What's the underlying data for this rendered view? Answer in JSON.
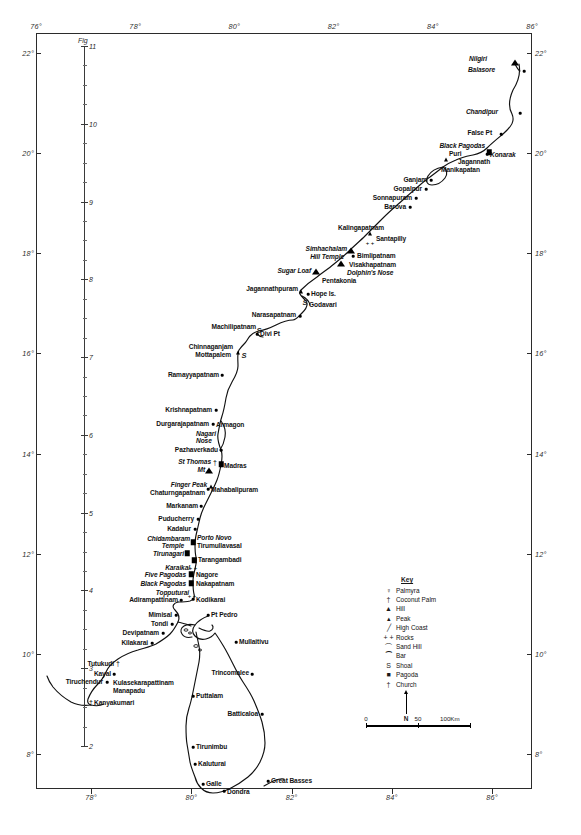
{
  "figure": {
    "caption_label": "Fig",
    "inner_scale_top_number": "11",
    "inner_scale_numbers": [
      "11",
      "10",
      "9",
      "8",
      "7",
      "6",
      "5",
      "4",
      "3",
      "2"
    ]
  },
  "axes": {
    "longitude_unit": "°",
    "top_ticks": [
      "76°",
      "78°",
      "80°",
      "82°",
      "84°",
      "86°"
    ],
    "bottom_ticks": [
      "78°",
      "80°",
      "82°",
      "84°",
      "86°"
    ],
    "left_ticks": [
      "22°",
      "20°",
      "18°",
      "16°",
      "14°",
      "12°",
      "10°",
      "8°"
    ],
    "right_ticks": [
      "22°",
      "20°",
      "18°",
      "16°",
      "14°",
      "12°",
      "10°",
      "8°"
    ]
  },
  "key": {
    "title": "Key",
    "items": [
      {
        "icon": "palmyra-icon",
        "glyph": "♀",
        "label": "Palmyra"
      },
      {
        "icon": "coconut-palm-icon",
        "glyph": "†",
        "label": "Coconut Palm"
      },
      {
        "icon": "hill-icon",
        "glyph": "▲",
        "label": "Hill"
      },
      {
        "icon": "peak-icon",
        "glyph": "▴",
        "label": "Peak"
      },
      {
        "icon": "high-coast-icon",
        "glyph": "╱",
        "label": "High Coast"
      },
      {
        "icon": "rocks-icon",
        "glyph": "+ +",
        "label": "Rocks"
      },
      {
        "icon": "sand-hill-icon",
        "glyph": "⌒",
        "label": "Sand Hill"
      },
      {
        "icon": "bar-icon",
        "glyph": "⁀",
        "label": "Bar"
      },
      {
        "icon": "shoal-icon",
        "glyph": "S",
        "label": "Shoal"
      },
      {
        "icon": "pagoda-icon",
        "glyph": "■",
        "label": "Pagoda"
      },
      {
        "icon": "church-icon",
        "glyph": "†",
        "label": "Church"
      }
    ]
  },
  "north_arrow": {
    "label": "N"
  },
  "scale_bar": {
    "start": "0",
    "middle": "50",
    "end": "100Km"
  },
  "places": [
    {
      "name": "Nilgiri",
      "x": 487,
      "y": 59,
      "align": "r",
      "italic": true,
      "symbol": "hill",
      "sx": 515,
      "sy": 63
    },
    {
      "name": "Balasore",
      "x": 495,
      "y": 70,
      "align": "r",
      "italic": true,
      "symbol": "dot",
      "sx": 524,
      "sy": 71
    },
    {
      "name": "Chandipur",
      "x": 498,
      "y": 112,
      "align": "r",
      "italic": true,
      "symbol": "dot",
      "sx": 520,
      "sy": 113
    },
    {
      "name": "False Pt",
      "x": 492,
      "y": 133,
      "align": "r",
      "italic": false,
      "symbol": "dot",
      "sx": 501,
      "sy": 134
    },
    {
      "name": "Black Pagodas",
      "x": 485,
      "y": 146,
      "align": "r",
      "italic": true,
      "symbol": "pagoda",
      "sx": 489,
      "sy": 152
    },
    {
      "name": "Konarak",
      "x": 490,
      "y": 155,
      "align": "l",
      "italic": true,
      "symbol": "dot",
      "sx": 487,
      "sy": 154
    },
    {
      "name": "Puri",
      "x": 449,
      "y": 154,
      "align": "l",
      "italic": false,
      "symbol": "peak",
      "sx": 446,
      "sy": 160
    },
    {
      "name": "Jagannath",
      "x": 458,
      "y": 162,
      "align": "l",
      "italic": false,
      "symbol": "none",
      "sx": 0,
      "sy": 0
    },
    {
      "name": "Manikapatan",
      "x": 441,
      "y": 170,
      "align": "l",
      "italic": false,
      "symbol": "none",
      "sx": 0,
      "sy": 0
    },
    {
      "name": "Ganjam",
      "x": 427,
      "y": 180,
      "align": "r",
      "italic": false,
      "symbol": "dot",
      "sx": 431,
      "sy": 180
    },
    {
      "name": "Gopalpur",
      "x": 422,
      "y": 189,
      "align": "r",
      "italic": false,
      "symbol": "dot",
      "sx": 426,
      "sy": 189
    },
    {
      "name": "Sonnapuram",
      "x": 412,
      "y": 198,
      "align": "r",
      "italic": false,
      "symbol": "dot",
      "sx": 416,
      "sy": 198
    },
    {
      "name": "Barova",
      "x": 406,
      "y": 207,
      "align": "r",
      "italic": false,
      "symbol": "dot",
      "sx": 410,
      "sy": 207
    },
    {
      "name": "Kalingapatnam",
      "x": 384,
      "y": 228,
      "align": "r",
      "italic": false,
      "symbol": "peak",
      "sx": 370,
      "sy": 234
    },
    {
      "name": "Santapilly",
      "x": 376,
      "y": 239,
      "align": "l",
      "italic": false,
      "symbol": "rocks",
      "sx": 370,
      "sy": 243
    },
    {
      "name": "Simhachalam",
      "x": 347,
      "y": 249,
      "align": "r",
      "italic": true,
      "symbol": "hill",
      "sx": 351,
      "sy": 251
    },
    {
      "name": "Hill Temple",
      "x": 344,
      "y": 257,
      "align": "r",
      "italic": true,
      "symbol": "none",
      "sx": 0,
      "sy": 0
    },
    {
      "name": "Bimlipatnam",
      "x": 357,
      "y": 256,
      "align": "l",
      "italic": false,
      "symbol": "dot",
      "sx": 353,
      "sy": 256
    },
    {
      "name": "Visakhapatnam",
      "x": 349,
      "y": 265,
      "align": "l",
      "italic": false,
      "symbol": "hill",
      "sx": 341,
      "sy": 264
    },
    {
      "name": "Dolphin's Nose",
      "x": 347,
      "y": 273,
      "align": "l",
      "italic": true,
      "symbol": "none",
      "sx": 0,
      "sy": 0
    },
    {
      "name": "Sugar Loaf",
      "x": 311,
      "y": 271,
      "align": "r",
      "italic": true,
      "symbol": "hill",
      "sx": 316,
      "sy": 272
    },
    {
      "name": "Pentakonia",
      "x": 322,
      "y": 281,
      "align": "l",
      "italic": false,
      "symbol": "none",
      "sx": 0,
      "sy": 0
    },
    {
      "name": "Jagannathpuram",
      "x": 298,
      "y": 289,
      "align": "r",
      "italic": false,
      "symbol": "peak",
      "sx": 301,
      "sy": 292
    },
    {
      "name": "Hope Is.",
      "x": 311,
      "y": 294,
      "align": "l",
      "italic": false,
      "symbol": "dot",
      "sx": 308,
      "sy": 294
    },
    {
      "name": "Godavari",
      "x": 309,
      "y": 305,
      "align": "l",
      "italic": false,
      "symbol": "shoal",
      "sx": 305,
      "sy": 302
    },
    {
      "name": "Narasapatnam",
      "x": 296,
      "y": 315,
      "align": "r",
      "italic": false,
      "symbol": "dot",
      "sx": 300,
      "sy": 316
    },
    {
      "name": "Machilipatnam",
      "x": 256,
      "y": 327,
      "align": "r",
      "italic": false,
      "symbol": "shoal",
      "sx": 259,
      "sy": 330
    },
    {
      "name": "Divi Pt",
      "x": 260,
      "y": 334,
      "align": "l",
      "italic": false,
      "symbol": "dot",
      "sx": 257,
      "sy": 334
    },
    {
      "name": "Chinnaganjam",
      "x": 233,
      "y": 347,
      "align": "r",
      "italic": false,
      "symbol": "peak",
      "sx": 238,
      "sy": 353
    },
    {
      "name": "Mottapalem",
      "x": 231,
      "y": 355,
      "align": "r",
      "italic": false,
      "symbol": "shoal",
      "sx": 244,
      "sy": 355
    },
    {
      "name": "Ramayyapatnam",
      "x": 219,
      "y": 375,
      "align": "r",
      "italic": false,
      "symbol": "dot",
      "sx": 222,
      "sy": 375
    },
    {
      "name": "Krishnapatnam",
      "x": 212,
      "y": 410,
      "align": "r",
      "italic": false,
      "symbol": "dot",
      "sx": 216,
      "sy": 410
    },
    {
      "name": "Durgarajapatnam",
      "x": 209,
      "y": 424,
      "align": "r",
      "italic": false,
      "symbol": "dot",
      "sx": 213,
      "sy": 424
    },
    {
      "name": "Armagon",
      "x": 216,
      "y": 425,
      "align": "l",
      "italic": false,
      "symbol": "none",
      "sx": 0,
      "sy": 0
    },
    {
      "name": "Nagari",
      "x": 196,
      "y": 434,
      "align": "l",
      "italic": true,
      "symbol": "none",
      "sx": 0,
      "sy": 0
    },
    {
      "name": "Nose",
      "x": 196,
      "y": 441,
      "align": "l",
      "italic": true,
      "symbol": "none",
      "sx": 0,
      "sy": 0
    },
    {
      "name": "Pazhaverkadu",
      "x": 218,
      "y": 450,
      "align": "r",
      "italic": false,
      "symbol": "dot",
      "sx": 221,
      "sy": 450
    },
    {
      "name": "St Thomas",
      "x": 211,
      "y": 462,
      "align": "r",
      "italic": true,
      "symbol": "church",
      "sx": 215,
      "sy": 462
    },
    {
      "name": "Mt",
      "x": 205,
      "y": 470,
      "align": "r",
      "italic": true,
      "symbol": "hill",
      "sx": 209,
      "sy": 471
    },
    {
      "name": "Madras",
      "x": 224,
      "y": 466,
      "align": "l",
      "italic": false,
      "symbol": "pagoda",
      "sx": 221,
      "sy": 464
    },
    {
      "name": "Finger Peak",
      "x": 207,
      "y": 485,
      "align": "r",
      "italic": true,
      "symbol": "peak",
      "sx": 211,
      "sy": 487
    },
    {
      "name": "Mahabalipuram",
      "x": 211,
      "y": 490,
      "align": "l",
      "italic": false,
      "symbol": "dot",
      "sx": 208,
      "sy": 489
    },
    {
      "name": "Chaturngapatnam",
      "x": 205,
      "y": 493,
      "align": "r",
      "italic": false,
      "symbol": "none",
      "sx": 0,
      "sy": 0
    },
    {
      "name": "Markanam",
      "x": 198,
      "y": 506,
      "align": "r",
      "italic": false,
      "symbol": "dot",
      "sx": 201,
      "sy": 506
    },
    {
      "name": "Puducherry",
      "x": 194,
      "y": 519,
      "align": "r",
      "italic": false,
      "symbol": "dot",
      "sx": 198,
      "sy": 519
    },
    {
      "name": "Kadalur",
      "x": 191,
      "y": 529,
      "align": "r",
      "italic": false,
      "symbol": "dot",
      "sx": 195,
      "sy": 529
    },
    {
      "name": "Chidambaram",
      "x": 190,
      "y": 539,
      "align": "r",
      "italic": true,
      "symbol": "pagoda",
      "sx": 193,
      "sy": 542
    },
    {
      "name": "Temple",
      "x": 184,
      "y": 546,
      "align": "r",
      "italic": true,
      "symbol": "none",
      "sx": 0,
      "sy": 0
    },
    {
      "name": "Porto Novo",
      "x": 197,
      "y": 538,
      "align": "l",
      "italic": true,
      "symbol": "none",
      "sx": 0,
      "sy": 0
    },
    {
      "name": "Tirumullavasal",
      "x": 197,
      "y": 546,
      "align": "l",
      "italic": false,
      "symbol": "none",
      "sx": 0,
      "sy": 0
    },
    {
      "name": "Tirunagari",
      "x": 184,
      "y": 554,
      "align": "r",
      "italic": true,
      "symbol": "pagoda",
      "sx": 187,
      "sy": 553
    },
    {
      "name": "Tarangambadi",
      "x": 198,
      "y": 560,
      "align": "l",
      "italic": false,
      "symbol": "pagoda",
      "sx": 194,
      "sy": 560
    },
    {
      "name": "Karaikal",
      "x": 190,
      "y": 568,
      "align": "r",
      "italic": true,
      "symbol": "rocks",
      "sx": 193,
      "sy": 568
    },
    {
      "name": "Five Pagodas",
      "x": 186,
      "y": 575,
      "align": "r",
      "italic": true,
      "symbol": "pagoda",
      "sx": 191,
      "sy": 574
    },
    {
      "name": "Nagore",
      "x": 196,
      "y": 575,
      "align": "l",
      "italic": false,
      "symbol": "none",
      "sx": 0,
      "sy": 0
    },
    {
      "name": "Black Pagodas",
      "x": 186,
      "y": 584,
      "align": "r",
      "italic": true,
      "symbol": "pagoda",
      "sx": 191,
      "sy": 583
    },
    {
      "name": "Nakapatnam",
      "x": 196,
      "y": 584,
      "align": "l",
      "italic": false,
      "symbol": "none",
      "sx": 0,
      "sy": 0
    },
    {
      "name": "Topputurai",
      "x": 189,
      "y": 593,
      "align": "r",
      "italic": true,
      "symbol": "rocks",
      "sx": 192,
      "sy": 596
    },
    {
      "name": "Adirampattinam",
      "x": 178,
      "y": 600,
      "align": "r",
      "italic": false,
      "symbol": "dot",
      "sx": 181,
      "sy": 600
    },
    {
      "name": "Kodikarai",
      "x": 196,
      "y": 600,
      "align": "l",
      "italic": false,
      "symbol": "dot",
      "sx": 193,
      "sy": 599
    },
    {
      "name": "Mimisal",
      "x": 172,
      "y": 615,
      "align": "r",
      "italic": false,
      "symbol": "dot",
      "sx": 176,
      "sy": 615
    },
    {
      "name": "Tondi",
      "x": 168,
      "y": 624,
      "align": "r",
      "italic": false,
      "symbol": "dot",
      "sx": 172,
      "sy": 624
    },
    {
      "name": "Devipatnam",
      "x": 159,
      "y": 633,
      "align": "r",
      "italic": false,
      "symbol": "dot",
      "sx": 163,
      "sy": 633
    },
    {
      "name": "Kilakarai",
      "x": 148,
      "y": 643,
      "align": "r",
      "italic": false,
      "symbol": "dot",
      "sx": 152,
      "sy": 643
    },
    {
      "name": "Tutukudi",
      "x": 114,
      "y": 664,
      "align": "r",
      "italic": false,
      "symbol": "coconut",
      "sx": 118,
      "sy": 663
    },
    {
      "name": "Kayal",
      "x": 111,
      "y": 674,
      "align": "r",
      "italic": false,
      "symbol": "dot",
      "sx": 114,
      "sy": 674
    },
    {
      "name": "Tiruchendur",
      "x": 103,
      "y": 682,
      "align": "r",
      "italic": false,
      "symbol": "dot",
      "sx": 107,
      "sy": 682
    },
    {
      "name": "Kulasekarapattinam",
      "x": 113,
      "y": 683,
      "align": "l",
      "italic": false,
      "symbol": "none",
      "sx": 0,
      "sy": 0
    },
    {
      "name": "Manapadu",
      "x": 113,
      "y": 691,
      "align": "l",
      "italic": false,
      "symbol": "none",
      "sx": 0,
      "sy": 0
    },
    {
      "name": "Kanyakumari",
      "x": 94,
      "y": 703,
      "align": "l",
      "italic": false,
      "symbol": "coconut",
      "sx": 91,
      "sy": 702
    },
    {
      "name": "Pt Pedro",
      "x": 211,
      "y": 615,
      "align": "l",
      "italic": false,
      "symbol": "dot",
      "sx": 208,
      "sy": 615
    },
    {
      "name": "Mullaitivu",
      "x": 239,
      "y": 642,
      "align": "l",
      "italic": false,
      "symbol": "dot",
      "sx": 236,
      "sy": 642
    },
    {
      "name": "Trincomalee",
      "x": 249,
      "y": 673,
      "align": "r",
      "italic": false,
      "symbol": "dot",
      "sx": 252,
      "sy": 674
    },
    {
      "name": "Puttalam",
      "x": 196,
      "y": 696,
      "align": "l",
      "italic": false,
      "symbol": "dot",
      "sx": 193,
      "sy": 696
    },
    {
      "name": "Batticaloa",
      "x": 258,
      "y": 714,
      "align": "r",
      "italic": false,
      "symbol": "dot",
      "sx": 262,
      "sy": 714
    },
    {
      "name": "Tirunimbu",
      "x": 196,
      "y": 747,
      "align": "l",
      "italic": false,
      "symbol": "dot",
      "sx": 193,
      "sy": 747
    },
    {
      "name": "Kaluturai",
      "x": 198,
      "y": 764,
      "align": "l",
      "italic": false,
      "symbol": "dot",
      "sx": 195,
      "sy": 764
    },
    {
      "name": "Galle",
      "x": 206,
      "y": 784,
      "align": "l",
      "italic": false,
      "symbol": "dot",
      "sx": 203,
      "sy": 784
    },
    {
      "name": "Dondra",
      "x": 227,
      "y": 792,
      "align": "l",
      "italic": false,
      "symbol": "dot",
      "sx": 224,
      "sy": 791
    },
    {
      "name": "Great Basses",
      "x": 271,
      "y": 781,
      "align": "l",
      "italic": false,
      "symbol": "dot",
      "sx": 268,
      "sy": 781
    }
  ]
}
